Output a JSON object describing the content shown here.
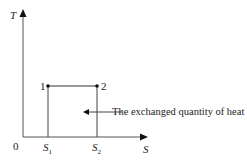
{
  "diagram": {
    "type": "T-S diagram",
    "y_axis": {
      "label": "T"
    },
    "x_axis": {
      "label": "S"
    },
    "origin_label": "0",
    "points": [
      {
        "label": "1",
        "s": "S1"
      },
      {
        "label": "2",
        "s": "S2"
      }
    ],
    "ticks": [
      {
        "base": "S",
        "sub": "1"
      },
      {
        "base": "S",
        "sub": "2"
      }
    ],
    "annotation": "The exchanged quantity of heat",
    "colors": {
      "line": "#333333",
      "text": "#222222"
    }
  }
}
